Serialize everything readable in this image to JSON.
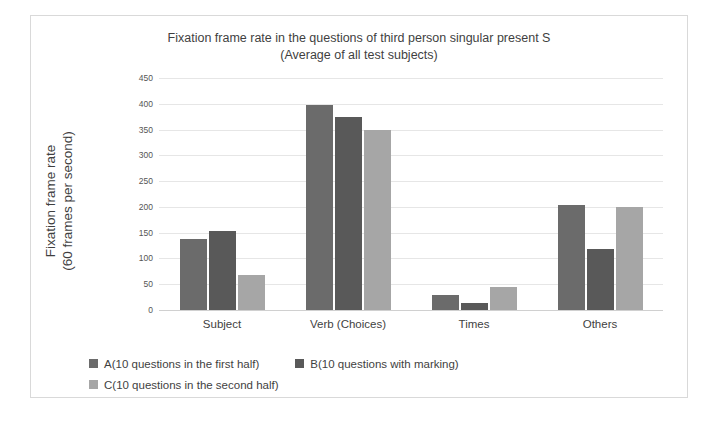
{
  "chart_data": {
    "type": "bar",
    "title": "Fixation frame rate in the questions of third person singular present S",
    "subtitle": "(Average of all test subjects)",
    "xlabel": "",
    "ylabel_line1": "Fixation frame rate",
    "ylabel_line2": "(60 frames per second)",
    "categories": [
      "Subject",
      "Verb (Choices)",
      "Times",
      "Others"
    ],
    "series": [
      {
        "name": "A(10 questions in the first half)",
        "color": "#6b6b6b",
        "values": [
          138,
          397,
          30,
          203
        ]
      },
      {
        "name": "B(10 questions with marking)",
        "color": "#595959",
        "values": [
          153,
          375,
          14,
          118
        ]
      },
      {
        "name": "C(10 questions in the second half)",
        "color": "#a6a6a6",
        "values": [
          68,
          350,
          45,
          199
        ]
      }
    ],
    "ylim": [
      0,
      450
    ],
    "ytick_step": 50,
    "yticks": [
      0,
      50,
      100,
      150,
      200,
      250,
      300,
      350,
      400,
      450
    ],
    "ytick_labels": [
      "0",
      "50",
      "100",
      "150",
      "200",
      "250",
      "300",
      "350",
      "400",
      "450"
    ],
    "grid": true,
    "legend_position": "bottom"
  }
}
